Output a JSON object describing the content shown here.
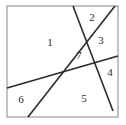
{
  "figure": {
    "kind": "plane-subdivision-diagram",
    "width": 126,
    "height": 125,
    "background_color": "#ffffff",
    "stroke_color": "#2b2b2b",
    "border": {
      "name": "square-frame",
      "x": 7,
      "y": 6,
      "width": 111,
      "height": 111,
      "stroke_color": "#9a9a9a",
      "stroke_width": 1.2
    },
    "lines": [
      {
        "id": "line-a",
        "description": "steep line descending from top edge to lower right",
        "x1": 73,
        "y1": 6,
        "x2": 113,
        "y2": 111,
        "stroke_width": 1.6
      },
      {
        "id": "line-b",
        "description": "steep line ascending from bottom edge to top right",
        "x1": 28,
        "y1": 117,
        "x2": 115,
        "y2": 6,
        "stroke_width": 1.6
      },
      {
        "id": "line-c",
        "description": "shallow line ascending from left edge to right edge",
        "x1": 7,
        "y1": 88,
        "x2": 118,
        "y2": 56,
        "stroke_width": 1.6
      }
    ],
    "intersections": [
      {
        "id": "line-a-x-line-b",
        "x": 88,
        "y": 35
      },
      {
        "id": "line-a-x-line-c",
        "x": 100,
        "y": 62
      },
      {
        "id": "line-b-x-line-c",
        "x": 52,
        "y": 78
      }
    ],
    "region_labels": [
      {
        "id": "region-1",
        "text": "1",
        "x": 50,
        "y": 43
      },
      {
        "id": "region-2",
        "text": "2",
        "x": 92,
        "y": 18
      },
      {
        "id": "region-3",
        "text": "3",
        "x": 101,
        "y": 41
      },
      {
        "id": "region-4",
        "text": "4",
        "x": 110,
        "y": 73
      },
      {
        "id": "region-5",
        "text": "5",
        "x": 84,
        "y": 99
      },
      {
        "id": "region-6",
        "text": "6",
        "x": 21,
        "y": 100
      },
      {
        "id": "region-7",
        "text": "7",
        "x": 79,
        "y": 56
      }
    ]
  }
}
